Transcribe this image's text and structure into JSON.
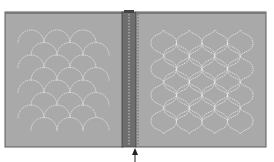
{
  "diagram": {
    "title": "",
    "colors": {
      "background": "#ffffff",
      "panel_fill": "#a9a9a9",
      "panel_border": "#5a5a5a",
      "panel_top_edge": "#7a7a7a",
      "spine_fill": "#6e6e6e",
      "spine_dash": "#c8c8c8",
      "stitch": "#e6e6e6",
      "arrow": "#222222"
    },
    "left_panel": {
      "label": "",
      "pattern": "clamshell-scallop",
      "columns": 4,
      "rows": 8
    },
    "right_panel": {
      "label": "",
      "pattern": "ogee-lantern",
      "columns": 4,
      "rows": 4
    },
    "spine": {
      "label": "",
      "seam_lines": 2
    },
    "arrow": {
      "label": "",
      "direction": "up",
      "target": "seam"
    }
  }
}
